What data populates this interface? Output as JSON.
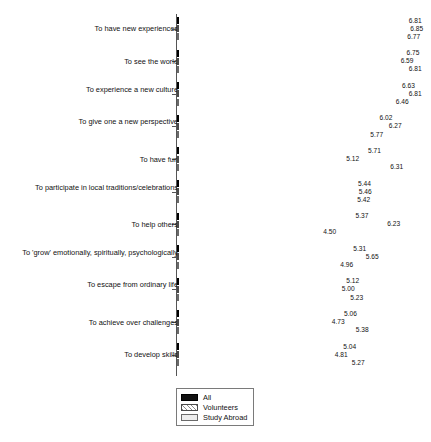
{
  "chart_data": {
    "type": "bar",
    "orientation": "horizontal",
    "title": "",
    "subtitle": "",
    "xlabel": "",
    "ylabel": "",
    "xlim": [
      0.6,
      7.2
    ],
    "grid": false,
    "legend_position": "bottom-left",
    "categories": [
      "To have new experiences",
      "To see the world",
      "To experience a new culture",
      "To give one a new perspective",
      "To have fun",
      "To participate in local traditions/celebrations",
      "To help others",
      "To 'grow' emotionally, spiritually, psychologically",
      "To escape from ordinary life",
      "To achieve over challenges",
      "To develop skills"
    ],
    "series": [
      {
        "name": "All",
        "color": "#111111",
        "values": [
          6.81,
          6.75,
          6.63,
          6.02,
          5.71,
          5.44,
          5.37,
          5.31,
          5.12,
          5.06,
          5.04
        ],
        "labels": [
          "6.81",
          "6.75",
          "6.63",
          "6.02",
          "5.71",
          "5.44",
          "5.37",
          "5.31",
          "5.12",
          "5.06",
          "5.04"
        ]
      },
      {
        "name": "Volunteers",
        "color": "#8c8c8c",
        "values": [
          6.85,
          6.59,
          6.81,
          6.27,
          5.12,
          5.46,
          6.23,
          5.65,
          5.0,
          4.73,
          4.81
        ],
        "labels": [
          "6.85",
          "6.59",
          "6.81",
          "6.27",
          "5.12",
          "5.46",
          "6.23",
          "5.65",
          "5.00",
          "4.73",
          "4.81"
        ]
      },
      {
        "name": "Study Abroad",
        "color": "#ededed",
        "values": [
          6.77,
          6.81,
          6.46,
          5.77,
          6.31,
          5.42,
          4.5,
          4.96,
          5.23,
          5.38,
          5.27
        ],
        "labels": [
          "6.77",
          "6.81",
          "6.46",
          "5.77",
          "6.31",
          "5.42",
          "4.50",
          "4.96",
          "5.23",
          "5.38",
          "5.27"
        ]
      }
    ]
  },
  "legend": {
    "items": [
      {
        "label": "All",
        "swatch": "all-swatch"
      },
      {
        "label": "Volunteers",
        "swatch": "volunteers-swatch"
      },
      {
        "label": "Study Abroad",
        "swatch": "study-abroad-swatch"
      }
    ]
  }
}
